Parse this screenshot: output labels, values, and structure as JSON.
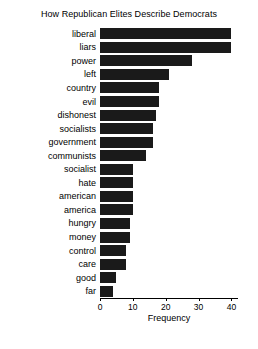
{
  "chart_data": {
    "type": "bar",
    "orientation": "horizontal",
    "title": "How Republican Elites Describe Democrats",
    "xlabel": "Frequency",
    "ylabel": "",
    "xlim": [
      0,
      42
    ],
    "xticks": [
      0,
      10,
      20,
      30,
      40
    ],
    "xticklabels": [
      "0",
      "10",
      "20",
      "30",
      "40"
    ],
    "grid": false,
    "legend": null,
    "bar_color": "#1a1a1a",
    "categories": [
      "liberal",
      "liars",
      "power",
      "left",
      "country",
      "evil",
      "dishonest",
      "socialists",
      "government",
      "communists",
      "socialist",
      "hate",
      "american",
      "america",
      "hungry",
      "money",
      "control",
      "care",
      "good",
      "far"
    ],
    "values": [
      40,
      40,
      28,
      21,
      18,
      18,
      17,
      16,
      16,
      14,
      10,
      10,
      10,
      10,
      9,
      9,
      8,
      8,
      5,
      4
    ]
  }
}
